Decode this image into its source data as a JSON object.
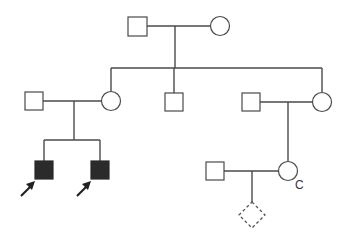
{
  "diagram": {
    "type": "pedigree",
    "colors": {
      "line": "#4a4a4a",
      "affected_fill": "#2b2b2b",
      "background": "#ffffff"
    },
    "generations": [
      {
        "level": "I",
        "individuals": [
          {
            "id": "I-1",
            "sex": "male",
            "status": "unaffected"
          },
          {
            "id": "I-2",
            "sex": "female",
            "status": "unaffected"
          }
        ]
      },
      {
        "level": "II",
        "individuals": [
          {
            "id": "II-1",
            "sex": "male",
            "status": "unaffected",
            "note": "spouse"
          },
          {
            "id": "II-2",
            "sex": "female",
            "status": "unaffected"
          },
          {
            "id": "II-3",
            "sex": "male",
            "status": "unaffected"
          },
          {
            "id": "II-4",
            "sex": "male",
            "status": "unaffected",
            "note": "spouse"
          },
          {
            "id": "II-5",
            "sex": "female",
            "status": "unaffected"
          }
        ]
      },
      {
        "level": "III",
        "individuals": [
          {
            "id": "III-1",
            "sex": "male",
            "status": "affected",
            "proband_arrow": true
          },
          {
            "id": "III-2",
            "sex": "male",
            "status": "affected",
            "proband_arrow": true
          },
          {
            "id": "III-3",
            "sex": "male",
            "status": "unaffected",
            "note": "spouse"
          },
          {
            "id": "III-4",
            "sex": "female",
            "status": "unaffected",
            "label": "C"
          }
        ]
      },
      {
        "level": "IV",
        "individuals": [
          {
            "id": "IV-1",
            "sex": "unknown",
            "status": "unborn/pregnancy",
            "style": "dashed-diamond"
          }
        ]
      }
    ],
    "labels": {
      "carrier_label": "C"
    }
  }
}
